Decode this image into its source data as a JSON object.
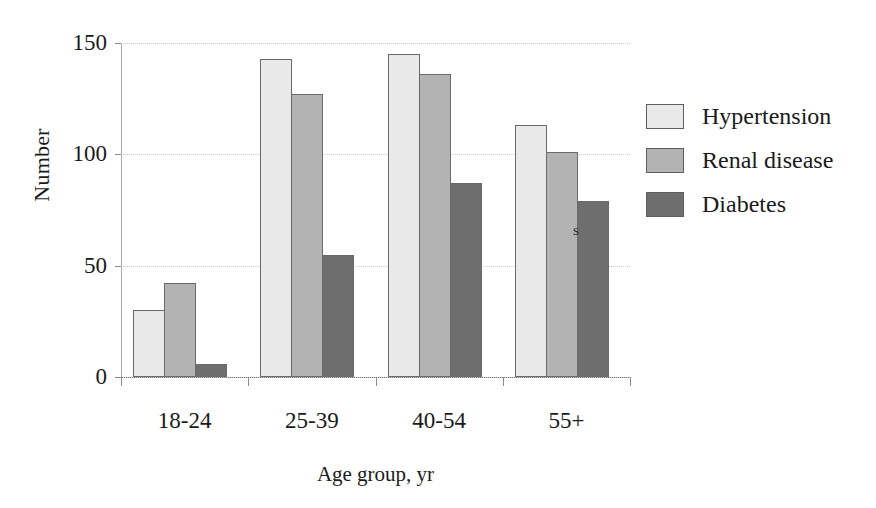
{
  "chart_data": {
    "type": "bar",
    "title": "",
    "xlabel": "Age group, yr",
    "ylabel": "Number",
    "categories": [
      "18-24",
      "25-39",
      "40-54",
      "55+"
    ],
    "series": [
      {
        "name": "Hypertension",
        "color": "#e9e9e9",
        "values": [
          30,
          143,
          145,
          113
        ]
      },
      {
        "name": "Renal disease",
        "color": "#b3b3b3",
        "values": [
          42,
          127,
          136,
          101
        ]
      },
      {
        "name": "Diabetes",
        "color": "#6e6e6e",
        "values": [
          6,
          55,
          87,
          79
        ]
      }
    ],
    "ylim": [
      0,
      150
    ],
    "yticks": [
      0,
      50,
      100,
      150
    ],
    "ytick_labels": [
      "0",
      "50",
      "100",
      "150"
    ],
    "grid": true,
    "legend_position": "right"
  },
  "legend": {
    "items": [
      {
        "label": "Hypertension",
        "color": "#e9e9e9"
      },
      {
        "label": "Renal disease",
        "color": "#b3b3b3"
      },
      {
        "label": "Diabetes",
        "color": "#6e6e6e"
      }
    ]
  },
  "annotations": {
    "stray_glyph": "s"
  }
}
